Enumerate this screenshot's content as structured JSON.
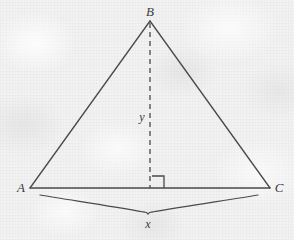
{
  "figure": {
    "kind": "geometry-diagram",
    "width": 294,
    "height": 240,
    "background_color": "#f2f2f2",
    "stroke_color": "#4a4a4a",
    "label_color": "#3b3b3b"
  },
  "labels": {
    "apex": "B",
    "left_vertex": "A",
    "right_vertex": "C",
    "altitude": "y",
    "base": "x"
  },
  "geometry": {
    "apex_point": {
      "x": 150,
      "y": 21
    },
    "left_point": {
      "x": 30,
      "y": 188
    },
    "right_point": {
      "x": 270,
      "y": 188
    },
    "altitude_foot": {
      "x": 150,
      "y": 188
    },
    "right_angle_size": 12,
    "brace_left": {
      "x": 40,
      "y": 195
    },
    "brace_right": {
      "x": 258,
      "y": 195
    },
    "brace_tip": {
      "x": 148,
      "y": 212
    },
    "dash_pattern": "5,4"
  },
  "label_positions": {
    "apex": {
      "x": 150,
      "y": 16
    },
    "left_vertex": {
      "x": 21,
      "y": 192
    },
    "right_vertex": {
      "x": 279,
      "y": 192
    },
    "altitude": {
      "x": 142,
      "y": 121
    },
    "base": {
      "x": 148,
      "y": 228
    }
  }
}
